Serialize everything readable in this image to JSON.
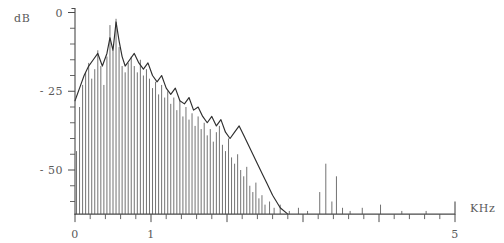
{
  "chart_data": {
    "type": "bar",
    "title": "",
    "subtitle": "",
    "xlabel": "KHz",
    "ylabel": "dB",
    "xlim": [
      0,
      5
    ],
    "ylim": [
      -65,
      0
    ],
    "grid": false,
    "legend": null,
    "x_tick_labels": [
      "0",
      "1",
      "5"
    ],
    "x_tick_values": [
      0,
      1,
      5
    ],
    "x_minor_tick_step": 0.2,
    "y_tick_labels": [
      "0",
      "- 25",
      "- 50"
    ],
    "y_tick_values": [
      0,
      -25,
      -50
    ],
    "y_minor_tick_step": 5,
    "baseline_db": -64,
    "series": [
      {
        "name": "harmonic-lines",
        "render": "spikes",
        "x": [
          0.02,
          0.06,
          0.1,
          0.14,
          0.18,
          0.22,
          0.26,
          0.3,
          0.34,
          0.38,
          0.42,
          0.46,
          0.5,
          0.54,
          0.58,
          0.62,
          0.66,
          0.7,
          0.74,
          0.78,
          0.82,
          0.86,
          0.9,
          0.94,
          0.98,
          1.02,
          1.06,
          1.1,
          1.14,
          1.18,
          1.22,
          1.26,
          1.3,
          1.34,
          1.38,
          1.42,
          1.46,
          1.5,
          1.54,
          1.58,
          1.62,
          1.66,
          1.7,
          1.74,
          1.78,
          1.82,
          1.86,
          1.9,
          1.94,
          1.98,
          2.02,
          2.06,
          2.1,
          2.14,
          2.18,
          2.22,
          2.26,
          2.3,
          2.34,
          2.38,
          2.42,
          2.46,
          2.5,
          2.56,
          2.62,
          2.7,
          2.82,
          2.94,
          3.06,
          3.22,
          3.3,
          3.38,
          3.44,
          3.52,
          3.62,
          3.78,
          4.02,
          4.3,
          4.62
        ],
        "values": [
          -44,
          -30,
          -23,
          -19,
          -16,
          -21,
          -18,
          -12,
          -17,
          -23,
          -14,
          -4,
          -12,
          -2,
          -11,
          -17,
          -19,
          -16,
          -14,
          -17,
          -19,
          -15,
          -20,
          -18,
          -21,
          -24,
          -22,
          -26,
          -23,
          -27,
          -25,
          -29,
          -27,
          -31,
          -28,
          -33,
          -30,
          -34,
          -32,
          -36,
          -33,
          -37,
          -35,
          -39,
          -37,
          -41,
          -38,
          -36,
          -42,
          -44,
          -40,
          -46,
          -48,
          -45,
          -50,
          -52,
          -49,
          -55,
          -57,
          -54,
          -59,
          -58,
          -61,
          -60,
          -62,
          -61,
          -63,
          -62,
          -63,
          -57,
          -48,
          -60,
          -52,
          -62,
          -63,
          -62,
          -61,
          -63,
          -63
        ]
      },
      {
        "name": "spectral-envelope",
        "render": "line",
        "x": [
          0.0,
          0.06,
          0.12,
          0.18,
          0.24,
          0.3,
          0.36,
          0.42,
          0.46,
          0.5,
          0.54,
          0.58,
          0.62,
          0.66,
          0.72,
          0.78,
          0.84,
          0.9,
          0.96,
          1.02,
          1.08,
          1.14,
          1.2,
          1.26,
          1.32,
          1.38,
          1.44,
          1.5,
          1.56,
          1.62,
          1.68,
          1.74,
          1.8,
          1.86,
          1.92,
          1.98,
          2.04,
          2.1,
          2.16,
          2.22,
          2.28,
          2.34,
          2.4,
          2.46,
          2.52,
          2.6,
          2.7,
          2.8
        ],
        "values": [
          -28,
          -24,
          -20,
          -17,
          -15,
          -13,
          -17,
          -13,
          -8,
          -12,
          -3,
          -9,
          -14,
          -17,
          -15,
          -13,
          -16,
          -18,
          -16,
          -20,
          -22,
          -20,
          -24,
          -26,
          -24,
          -28,
          -29,
          -27,
          -31,
          -30,
          -33,
          -35,
          -33,
          -36,
          -34,
          -38,
          -40,
          -38,
          -36,
          -39,
          -42,
          -45,
          -48,
          -51,
          -54,
          -58,
          -62,
          -64
        ]
      }
    ]
  }
}
